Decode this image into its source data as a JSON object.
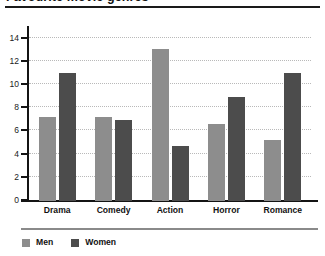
{
  "chart_data": {
    "type": "bar",
    "title": "Favourite movie genres",
    "categories": [
      "Drama",
      "Comedy",
      "Action",
      "Horror",
      "Romance"
    ],
    "series": [
      {
        "name": "Men",
        "color": "#8d8d8d",
        "values": [
          7.25,
          7.2,
          13.1,
          6.6,
          5.3
        ]
      },
      {
        "name": "Women",
        "color": "#4c4c4c",
        "values": [
          11.0,
          7.0,
          4.7,
          9.0,
          11.0
        ]
      }
    ],
    "xlabel": "",
    "ylabel": "",
    "ylim": [
      0,
      15
    ],
    "yticks": [
      0,
      2,
      4,
      6,
      8,
      10,
      12,
      14
    ],
    "ytick_labels": [
      "0",
      "2",
      "4",
      "6",
      "8",
      "10",
      "12",
      "14"
    ],
    "grid": true,
    "grid_style": "dotted-horizontal",
    "legend_position": "bottom-left"
  },
  "legend": {
    "items": [
      {
        "label": "Men",
        "color": "#8d8d8d"
      },
      {
        "label": "Women",
        "color": "#4c4c4c"
      }
    ]
  }
}
